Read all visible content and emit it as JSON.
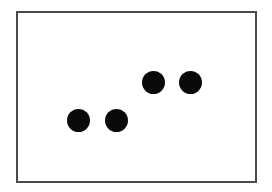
{
  "figure": {
    "frame": {
      "border_color": "#4a4a4a",
      "background": "#ffffff"
    },
    "dot_color": "#0a0a0a",
    "dots": [
      {
        "cx": 78,
        "cy": 120,
        "diameter": 23
      },
      {
        "cx": 116,
        "cy": 120,
        "diameter": 23
      },
      {
        "cx": 153,
        "cy": 82,
        "diameter": 23
      },
      {
        "cx": 190,
        "cy": 82,
        "diameter": 23
      }
    ]
  }
}
